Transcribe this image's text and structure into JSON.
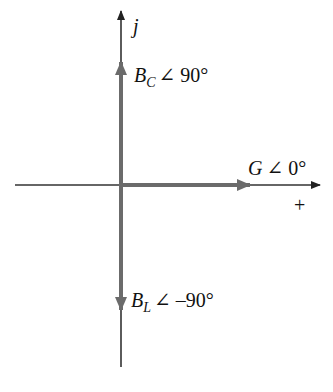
{
  "diagram": {
    "type": "phasor-diagram",
    "axes": {
      "vertical_label": "j",
      "horizontal_label": "+"
    },
    "phasors": [
      {
        "id": "susceptance-capacitive",
        "symbol": "B",
        "subscript": "C",
        "angle_text": "∠ 90°",
        "angle_deg": 90
      },
      {
        "id": "conductance",
        "symbol": "G",
        "subscript": "",
        "angle_text": "∠ 0°",
        "angle_deg": 0
      },
      {
        "id": "susceptance-inductive",
        "symbol": "B",
        "subscript": "L",
        "angle_text": "∠ –90°",
        "angle_deg": -90
      }
    ],
    "colors": {
      "axis": "#333333",
      "phasor": "#6b6b6b",
      "text": "#111111"
    }
  }
}
